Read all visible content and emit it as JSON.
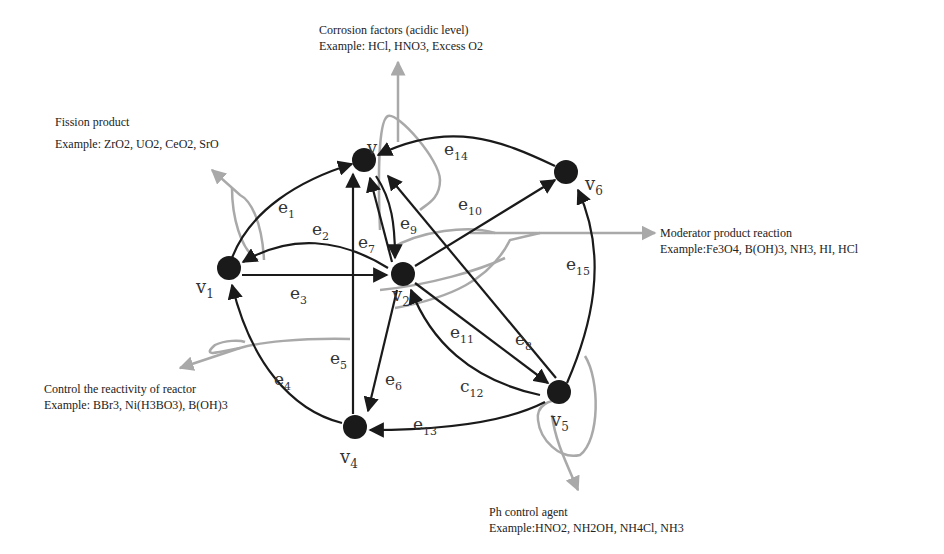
{
  "diagram": {
    "type": "directed-graph",
    "nodes": [
      {
        "id": "v1",
        "label": "v",
        "sub": "1",
        "x": 229,
        "y": 268
      },
      {
        "id": "v2",
        "label": "v",
        "sub": "2",
        "x": 403,
        "y": 274
      },
      {
        "id": "v3",
        "label": "v",
        "sub": "3",
        "x": 364,
        "y": 160
      },
      {
        "id": "v4",
        "label": "v",
        "sub": "4",
        "x": 355,
        "y": 427
      },
      {
        "id": "v5",
        "label": "v",
        "sub": "5",
        "x": 559,
        "y": 392
      },
      {
        "id": "v6",
        "label": "v",
        "sub": "6",
        "x": 566,
        "y": 172
      }
    ],
    "edges": [
      {
        "id": "e1",
        "label": "e",
        "sub": "1",
        "from": "v1",
        "to": "v3"
      },
      {
        "id": "e2",
        "label": "e",
        "sub": "2",
        "from": "v2",
        "to": "v1"
      },
      {
        "id": "e3",
        "label": "e",
        "sub": "3",
        "from": "v1",
        "to": "v2"
      },
      {
        "id": "e4",
        "label": "e",
        "sub": "4",
        "from": "v4",
        "to": "v1"
      },
      {
        "id": "e5",
        "label": "e",
        "sub": "5",
        "from": "v4",
        "to": "v3"
      },
      {
        "id": "e6",
        "label": "e",
        "sub": "6",
        "from": "v2",
        "to": "v4"
      },
      {
        "id": "e7",
        "label": "e",
        "sub": "7",
        "from": "v2",
        "to": "v3"
      },
      {
        "id": "e8",
        "label": "e",
        "sub": "8",
        "from": "v5",
        "to": "v3"
      },
      {
        "id": "e9",
        "label": "e",
        "sub": "9",
        "from": "v3",
        "to": "v2"
      },
      {
        "id": "e10",
        "label": "e",
        "sub": "10",
        "from": "v2",
        "to": "v6"
      },
      {
        "id": "e11",
        "label": "e",
        "sub": "11",
        "from": "v2",
        "to": "v5"
      },
      {
        "id": "e12",
        "label": "c",
        "sub": "12",
        "from": "v5",
        "to": "v2"
      },
      {
        "id": "e13",
        "label": "e",
        "sub": "13",
        "from": "v5",
        "to": "v4"
      },
      {
        "id": "e14",
        "label": "e",
        "sub": "14",
        "from": "v6",
        "to": "v3"
      },
      {
        "id": "e15",
        "label": "e",
        "sub": "15",
        "from": "v5",
        "to": "v6"
      }
    ],
    "annotations": {
      "corrosion": {
        "title": "Corrosion factors (acidic level)",
        "example": "Example: HCl, HNO3, Excess O2"
      },
      "fission": {
        "title": "Fission product",
        "example": "Example: ZrO2, UO2, CeO2, SrO"
      },
      "moderator": {
        "title": "Moderator product reaction",
        "example": "Example:Fe3O4, B(OH)3, NH3, HI, HCl"
      },
      "control": {
        "title": "Control the reactivity of reactor",
        "example": "Example: BBr3, Ni(H3BO3), B(OH)3"
      },
      "ph": {
        "title": "Ph control agent",
        "example": "Example:HNO2, NH2OH, NH4Cl, NH3"
      }
    },
    "colors": {
      "node": "#1a1a1a",
      "edge": "#1a1a1a",
      "annotation_arrow": "#a9a9a9",
      "text": "#222222"
    }
  }
}
